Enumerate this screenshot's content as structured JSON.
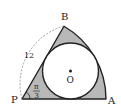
{
  "diagram": {
    "type": "geometry-sector-inscribed-circle",
    "labels": {
      "P": "P",
      "A": "A",
      "B": "B",
      "O": "O",
      "radius": "12",
      "angle_num": "π",
      "angle_den": "3"
    },
    "colors": {
      "shade": "#b8b8b8",
      "stroke": "#222222",
      "circle_fill": "#ffffff",
      "dashed": "#888888"
    }
  }
}
